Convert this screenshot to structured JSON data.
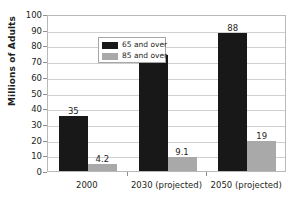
{
  "chart_data": {
    "type": "bar",
    "title": "",
    "subtitle": "",
    "xlabel": "",
    "ylabel": "Millions of Adults",
    "ylim": [
      0,
      100
    ],
    "ytick_step": 10,
    "yticks": [
      0,
      10,
      20,
      30,
      40,
      50,
      60,
      70,
      80,
      90,
      100
    ],
    "grid": "horizontal",
    "legend_position": "top-left-inside",
    "categories": [
      "2000",
      "2030 (projected)",
      "2050 (projected)"
    ],
    "series": [
      {
        "name": "65 and over",
        "color": "#181818",
        "values": [
          35,
          74.1,
          88
        ],
        "labels": [
          "35",
          "74.1",
          "88"
        ]
      },
      {
        "name": "85 and over",
        "color": "#a9a9a9",
        "values": [
          4.2,
          9.1,
          19
        ],
        "labels": [
          "4.2",
          "9.1",
          "19"
        ]
      }
    ]
  },
  "legend": {
    "entries": [
      {
        "label": "65 and over"
      },
      {
        "label": "85 and over"
      }
    ]
  }
}
